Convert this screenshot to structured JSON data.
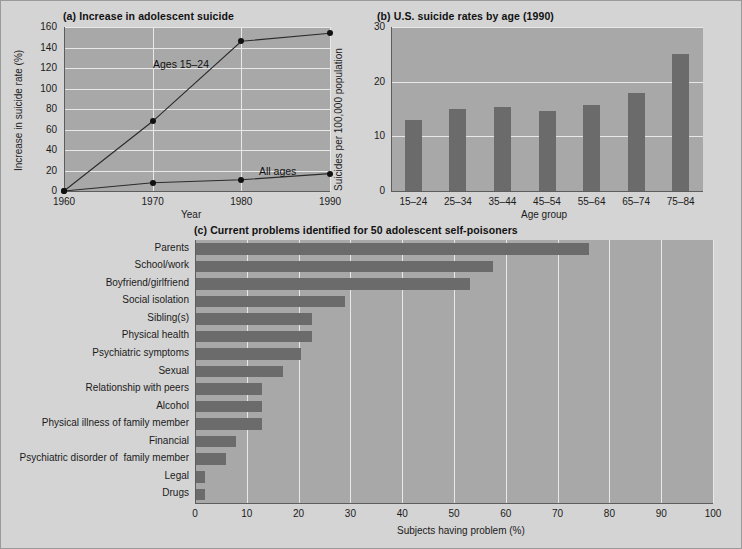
{
  "figure": {
    "background": "#d4d4d4",
    "plot_background": "#a8a8a8",
    "bar_color": "#6b6b6b",
    "grid_color": "#e8e8e8"
  },
  "panel_a": {
    "title": "(a) Increase in adolescent suicide",
    "xlabel": "Year",
    "ylabel": "Increase in suicide rate (%)",
    "xticks": [
      "1960",
      "1970",
      "1980",
      "1990"
    ],
    "yticks": [
      "0",
      "20",
      "40",
      "60",
      "80",
      "100",
      "120",
      "140",
      "160"
    ],
    "series_label_1": "Ages 15–24",
    "series_label_2": "All ages"
  },
  "panel_b": {
    "title": "(b) U.S. suicide rates by age (1990)",
    "xlabel": "Age group",
    "ylabel": "Suicides per 100,000 population",
    "yticks": [
      "0",
      "10",
      "20",
      "30"
    ],
    "xticks": [
      "15–24",
      "25–34",
      "35–44",
      "45–54",
      "55–64",
      "65–74",
      "75–84"
    ]
  },
  "panel_c": {
    "title": "(c) Current problems identified for 50 adolescent self-poisoners",
    "xlabel": "Subjects having problem (%)",
    "xticks": [
      "0",
      "10",
      "20",
      "30",
      "40",
      "50",
      "60",
      "70",
      "80",
      "90",
      "100"
    ],
    "categories": [
      "Parents",
      "School/work",
      "Boyfriend/girlfriend",
      "Social isolation",
      "Sibling(s)",
      "Physical health",
      "Psychiatric symptoms",
      "Sexual",
      "Relationship with peers",
      "Alcohol",
      "Physical illness of family member",
      "Financial",
      "Psychiatric disorder of  family member",
      "Legal",
      "Drugs"
    ]
  },
  "chart_data": [
    {
      "type": "line",
      "panel": "a",
      "title": "(a) Increase in adolescent suicide",
      "xlabel": "Year",
      "ylabel": "Increase in suicide rate (%)",
      "x": [
        1960,
        1970,
        1980,
        1990
      ],
      "xlim": [
        1960,
        1990
      ],
      "ylim": [
        0,
        160
      ],
      "yticks": [
        0,
        20,
        40,
        60,
        80,
        100,
        120,
        140,
        160
      ],
      "grid": true,
      "legend": "inline-annotations",
      "series": [
        {
          "name": "Ages 15–24",
          "values": [
            0,
            68,
            146,
            154
          ]
        },
        {
          "name": "All ages",
          "values": [
            0,
            8,
            11,
            17
          ]
        }
      ]
    },
    {
      "type": "bar",
      "panel": "b",
      "title": "(b) U.S. suicide rates by age (1990)",
      "xlabel": "Age group",
      "ylabel": "Suicides per 100,000 population",
      "categories": [
        "15–24",
        "25–34",
        "35–44",
        "45–54",
        "55–64",
        "65–74",
        "75–84"
      ],
      "values": [
        13.0,
        15.0,
        15.3,
        14.7,
        15.8,
        18.0,
        25.0
      ],
      "ylim": [
        0,
        30
      ],
      "yticks": [
        0,
        10,
        20,
        30
      ],
      "grid": true,
      "legend": "none"
    },
    {
      "type": "bar",
      "panel": "c",
      "orientation": "horizontal",
      "title": "(c) Current problems identified for 50 adolescent self-poisoners",
      "xlabel": "Subjects having problem (%)",
      "ylabel": "",
      "categories": [
        "Parents",
        "School/work",
        "Boyfriend/girlfriend",
        "Social isolation",
        "Sibling(s)",
        "Physical health",
        "Psychiatric symptoms",
        "Sexual",
        "Relationship with peers",
        "Alcohol",
        "Physical illness of family member",
        "Financial",
        "Psychiatric disorder of  family member",
        "Legal",
        "Drugs"
      ],
      "values": [
        76,
        57.5,
        53,
        29,
        22.5,
        22.5,
        20.5,
        17,
        13,
        13,
        13,
        8,
        6,
        2,
        2
      ],
      "xlim": [
        0,
        100
      ],
      "xticks": [
        0,
        10,
        20,
        30,
        40,
        50,
        60,
        70,
        80,
        90,
        100
      ],
      "grid": true,
      "legend": "none"
    }
  ]
}
